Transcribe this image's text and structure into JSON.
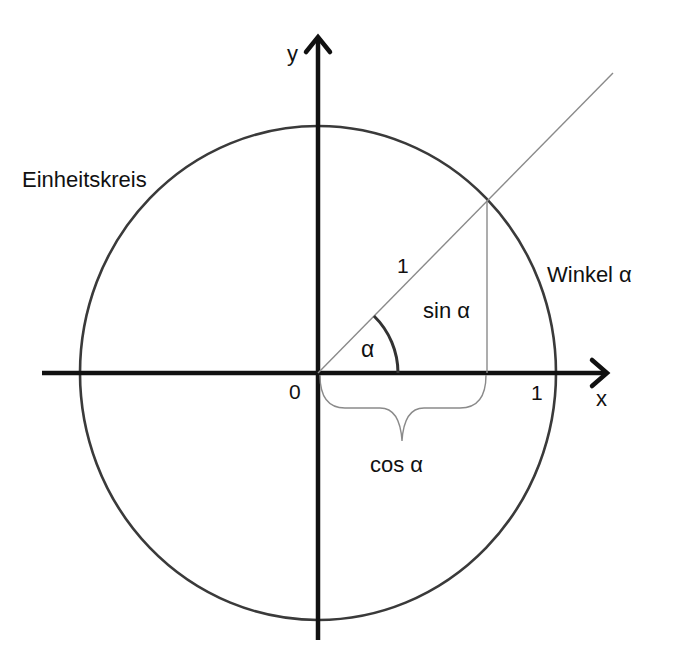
{
  "diagram": {
    "title_label": "Einheitskreis",
    "angle_label": "Winkel α",
    "axis_x_label": "x",
    "axis_y_label": "y",
    "origin_label": "0",
    "radius_label": "1",
    "x_unit_label": "1",
    "alpha_label": "α",
    "sin_label": "sin α",
    "cos_label": "cos α"
  },
  "colors": {
    "axis": "#111111",
    "circle": "#3a3a3a",
    "thin_line": "#8a8a8a",
    "arc": "#333333",
    "text": "#111111"
  }
}
